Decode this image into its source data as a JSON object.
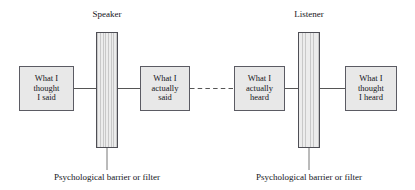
{
  "diagram": {
    "colors": {
      "box_fill": "#e8e8e8",
      "box_stroke": "#5b5b63",
      "barrier_fill": "#dcdcdc",
      "barrier_stroke": "#4e4e55",
      "connector": "#555555",
      "background": "#ffffff"
    },
    "top_labels": [
      {
        "id": "speaker",
        "text": "Speaker"
      },
      {
        "id": "listener",
        "text": "Listener"
      }
    ],
    "boxes": [
      {
        "id": "what-i-thought-i-said",
        "lines": [
          "What I",
          "thought",
          "I said"
        ]
      },
      {
        "id": "what-i-actually-said",
        "lines": [
          "What I",
          "actually",
          "said"
        ]
      },
      {
        "id": "what-i-actually-heard",
        "lines": [
          "What I",
          "actually",
          "heard"
        ]
      },
      {
        "id": "what-i-thought-i-heard",
        "lines": [
          "What I",
          "thought",
          "I heard"
        ]
      }
    ],
    "barriers": [
      {
        "id": "speaker-barrier",
        "caption": "Psychological barrier or filter"
      },
      {
        "id": "listener-barrier",
        "caption": "Psychological barrier or filter"
      }
    ],
    "connectors": {
      "solid_style": "solid",
      "transmission_style": "dashed"
    }
  }
}
